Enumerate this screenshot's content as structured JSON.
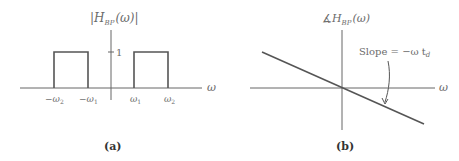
{
  "figure": {
    "panels": [
      {
        "id": "a",
        "caption": "(a)",
        "y_label_prefix": "|",
        "y_label_H": "H",
        "y_label_sub": "BP",
        "y_label_arg": "(ω)",
        "y_label_suffix": "|",
        "x_label": "ω",
        "level_label": "1",
        "ticks": [
          {
            "sign": "−",
            "sym": "ω",
            "sub": "2"
          },
          {
            "sign": "−",
            "sym": "ω",
            "sub": "1"
          },
          {
            "sign": "",
            "sym": "ω",
            "sub": "1"
          },
          {
            "sign": "",
            "sym": "ω",
            "sub": "2"
          }
        ],
        "description": "Magnitude response of ideal bandpass filter: unit-height passbands between ω1 and ω2 and between −ω2 and −ω1"
      },
      {
        "id": "b",
        "caption": "(b)",
        "y_label_angle": "∡",
        "y_label_H": "H",
        "y_label_sub": "BP",
        "y_label_arg": "(ω)",
        "x_label": "ω",
        "annotation_prefix": "Slope = −ω t",
        "annotation_sub": "d",
        "description": "Phase response: straight line through origin with negative slope"
      }
    ],
    "colors": {
      "axis": "#555555",
      "curve": "#555555",
      "text": "#6b6b6b"
    }
  }
}
